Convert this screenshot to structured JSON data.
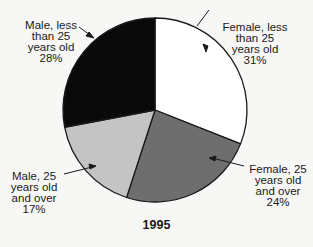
{
  "chart_data": {
    "type": "pie",
    "title": "1995",
    "start_angle_deg": 0,
    "direction": "clockwise",
    "slices": [
      {
        "label": "Female, less than 25 years old",
        "value": 31,
        "display": "Female, less\nthan 25\nyears old\n31%",
        "color": "#ffffff"
      },
      {
        "label": "Female, 25 years old and over",
        "value": 24,
        "display": "Female, 25\nyears old\nand over\n24%",
        "color": "#6e6e6e"
      },
      {
        "label": "Male, 25 years old and over",
        "value": 17,
        "display": "Male, 25\nyears old\nand over\n17%",
        "color": "#c4c4c4"
      },
      {
        "label": "Male, less than 25 years old",
        "value": 28,
        "display": "Male, less\nthan 25\nyears old\n28%",
        "color": "#0a0a0a"
      }
    ],
    "units": "%"
  }
}
